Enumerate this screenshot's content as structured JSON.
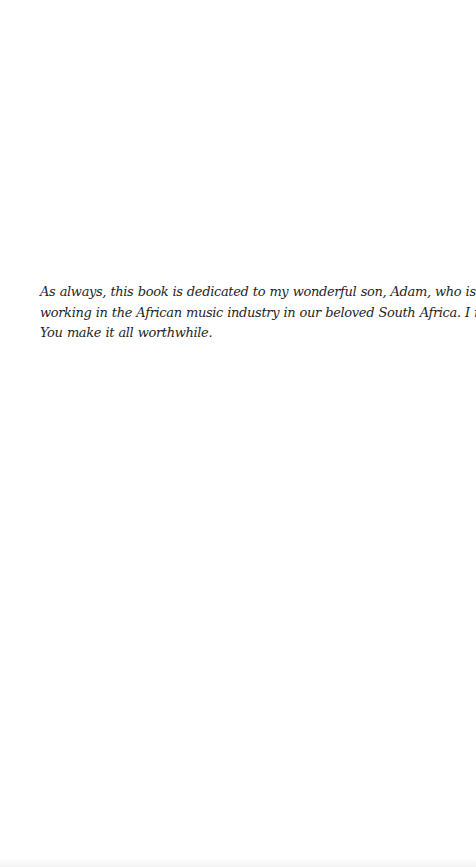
{
  "page": {
    "type": "dedication",
    "background": "#ffffff",
    "text_color": "#1f1f1f"
  },
  "dedication": {
    "lines": [
      "As always, this book is dedicated to my wonderful son, Adam, who is currently",
      "working in the African music industry in our beloved South Africa. I miss you.",
      "You make it all worthwhile."
    ],
    "full_text": "As always, this book is dedicated to my wonderful son, Adam, who is currently working in the African music industry in our beloved South Africa. I miss you. You make it all worthwhile."
  }
}
